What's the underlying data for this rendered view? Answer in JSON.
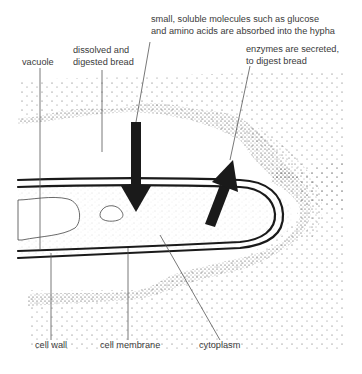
{
  "diagram": {
    "labels": {
      "absorbed_line1": "small, soluble molecules such as glucose",
      "absorbed_line2": "and amino acids are absorbed into the hypha",
      "dissolved_line1": "dissolved and",
      "dissolved_line2": "digested bread",
      "vacuole": "vacuole",
      "enzymes_line1": "enzymes are secreted,",
      "enzymes_line2": "to digest bread",
      "cell_wall": "cell wall",
      "cell_membrane": "cell membrane",
      "cytoplasm": "cytoplasm"
    },
    "arrows": [
      {
        "name": "absorption-arrow",
        "direction": "down"
      },
      {
        "name": "secretion-arrow",
        "direction": "up-right"
      }
    ],
    "colors": {
      "ink": "#1a1a1a",
      "label_text": "#3a3a3a",
      "leader_line": "#555555",
      "stipple": "#333333"
    }
  }
}
